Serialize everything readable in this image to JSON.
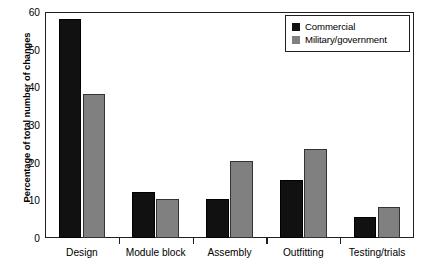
{
  "chart_data": {
    "type": "bar",
    "title": "",
    "xlabel": "",
    "ylabel": "Percentage of total number of changes",
    "ylim": [
      0,
      60
    ],
    "yticks": [
      0,
      10,
      20,
      30,
      40,
      50,
      60
    ],
    "ytick_labels": [
      "0",
      "10",
      "20",
      "30",
      "40",
      "50",
      "60"
    ],
    "grid": false,
    "legend_position": "top-right",
    "categories": [
      "Design",
      "Module block",
      "Assembly",
      "Outfitting",
      "Testing/trials"
    ],
    "series": [
      {
        "name": "Commercial",
        "color": "#111111",
        "values": [
          58.2,
          12.2,
          10.3,
          15.4,
          5.6
        ]
      },
      {
        "name": "Military/government",
        "color": "#808080",
        "values": [
          38.2,
          10.3,
          20.5,
          23.6,
          8.3
        ]
      }
    ]
  },
  "legend": {
    "items": [
      {
        "label": "Commercial",
        "swatch": "commercial"
      },
      {
        "label": "Military/government",
        "swatch": "military"
      }
    ]
  }
}
